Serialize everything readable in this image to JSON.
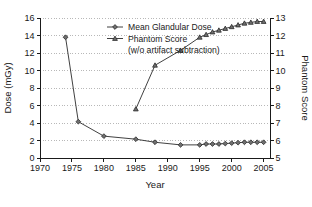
{
  "chart_data": {
    "type": "line",
    "title": "",
    "xlabel": "Year",
    "ylabel": "Dose (mGy)",
    "y2label": "Phantom Score",
    "xlim": [
      1970,
      2006
    ],
    "ylim": [
      0,
      16
    ],
    "y2lim": [
      5,
      13
    ],
    "xticks": [
      1970,
      1975,
      1980,
      1985,
      1990,
      1995,
      2000,
      2005
    ],
    "yticks": [
      0,
      2,
      4,
      6,
      8,
      10,
      12,
      14,
      16
    ],
    "y2ticks": [
      5,
      6,
      7,
      8,
      9,
      10,
      11,
      12,
      13
    ],
    "grid": "horizontal-dotted",
    "legend_position": "top-center",
    "legend_note": "(w/o artifact subtraction)",
    "series": [
      {
        "name": "Mean Glandular Dose",
        "axis": "left",
        "marker": "diamond",
        "x": [
          1974,
          1976,
          1980,
          1985,
          1988,
          1992,
          1995,
          1996,
          1997,
          1998,
          1999,
          2000,
          2001,
          2002,
          2003,
          2004,
          2005
        ],
        "values": [
          13.8,
          4.15,
          2.5,
          2.15,
          1.8,
          1.5,
          1.5,
          1.6,
          1.6,
          1.6,
          1.65,
          1.7,
          1.75,
          1.8,
          1.8,
          1.8,
          1.8
        ]
      },
      {
        "name": "Phantom Score",
        "axis": "right",
        "marker": "triangle",
        "x": [
          1985,
          1988,
          1992,
          1995,
          1996,
          1997,
          1998,
          1999,
          2000,
          2001,
          2002,
          2003,
          2004,
          2005
        ],
        "values": [
          7.8,
          10.3,
          11.15,
          11.9,
          12.05,
          12.2,
          12.3,
          12.4,
          12.5,
          12.6,
          12.7,
          12.75,
          12.8,
          12.8
        ]
      }
    ]
  },
  "legend": {
    "items": [
      {
        "label": "Mean Glandular Dose"
      },
      {
        "label": "Phantom Score"
      }
    ],
    "note": "(w/o artifact subtraction)"
  },
  "colors": {
    "axis": "#1a1a1a",
    "grid": "#9a9a9a",
    "series": "#2b2b2b",
    "marker_fill": "#6f6f6f",
    "background": "#ffffff"
  }
}
